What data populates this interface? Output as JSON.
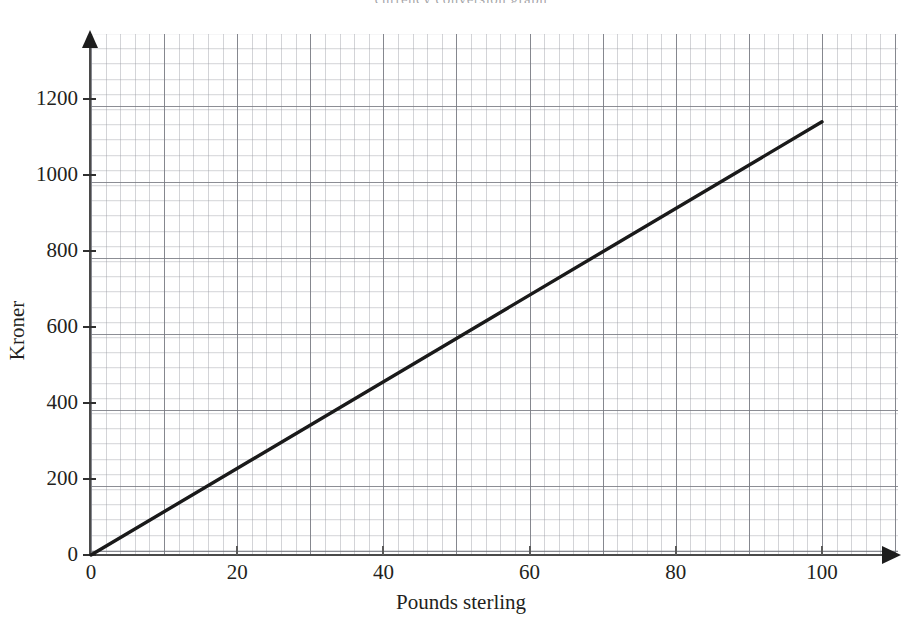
{
  "page": {
    "header_ghost": "currency conversion graph"
  },
  "chart_data": {
    "type": "line",
    "title": "",
    "xlabel": "Pounds sterling",
    "ylabel": "Kroner",
    "xlim": [
      0,
      110
    ],
    "ylim": [
      0,
      1280
    ],
    "xticks": [
      0,
      20,
      40,
      60,
      80,
      100
    ],
    "xtick_labels": [
      "0",
      "20",
      "40",
      "60",
      "80",
      "100"
    ],
    "yticks": [
      0,
      200,
      400,
      600,
      800,
      1000,
      1200
    ],
    "ytick_labels": [
      "0",
      "200",
      "400",
      "600",
      "800",
      "1000",
      "1200"
    ],
    "grid": true,
    "grid_major_spacing_x": 10,
    "grid_major_spacing_y": 200,
    "grid_minor_spacing_x": 2,
    "grid_minor_spacing_y": 40,
    "legend": "none",
    "series": [
      {
        "name": "Pounds to Kroner conversion",
        "x": [
          0,
          100
        ],
        "values": [
          0,
          1140
        ],
        "slope_kroner_per_pound": 11.4,
        "color": "#1a1a1a",
        "line_width": 3.4,
        "marker": "none"
      }
    ],
    "reference_points": [
      {
        "x": 20,
        "y": 228
      },
      {
        "x": 40,
        "y": 456
      },
      {
        "x": 60,
        "y": 684
      },
      {
        "x": 80,
        "y": 912
      },
      {
        "x": 100,
        "y": 1140
      }
    ],
    "colors": {
      "line": "#1a1a1a",
      "axis": "#3f3f3f",
      "grid_major": "#787a82",
      "grid_minor": "#969aa0",
      "text": "#231f20",
      "background": "#ffffff"
    }
  },
  "axis_titles": {
    "x": "Pounds sterling",
    "y": "Kroner"
  }
}
